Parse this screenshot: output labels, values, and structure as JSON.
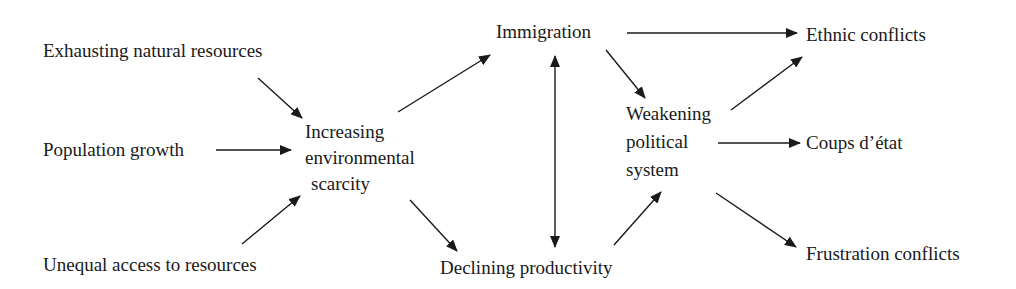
{
  "diagram": {
    "type": "causal-flow",
    "colors": {
      "text": "#1a1a1a",
      "arrow": "#1a1a1a",
      "background": "#ffffff"
    },
    "nodes": {
      "exhausting": {
        "label": "Exhausting natural resources"
      },
      "population": {
        "label": "Population growth"
      },
      "unequal": {
        "label": "Unequal access to resources"
      },
      "scarcity": {
        "lines": [
          "Increasing",
          "environmental",
          "scarcity"
        ]
      },
      "immigration": {
        "label": "Immigration"
      },
      "declining": {
        "label": "Declining productivity"
      },
      "weakening": {
        "lines": [
          "Weakening",
          "political",
          "system"
        ]
      },
      "ethnic": {
        "label": "Ethnic conflicts"
      },
      "coups": {
        "label": "Coups d’état"
      },
      "frustration": {
        "label": "Frustration conflicts"
      }
    },
    "edges": [
      {
        "from": "Exhausting natural resources",
        "to": "Increasing environmental scarcity"
      },
      {
        "from": "Population growth",
        "to": "Increasing environmental scarcity"
      },
      {
        "from": "Unequal access to resources",
        "to": "Increasing environmental scarcity"
      },
      {
        "from": "Increasing environmental scarcity",
        "to": "Immigration"
      },
      {
        "from": "Increasing environmental scarcity",
        "to": "Declining productivity"
      },
      {
        "from": "Immigration",
        "to": "Declining productivity",
        "bidirectional": true
      },
      {
        "from": "Immigration",
        "to": "Ethnic conflicts"
      },
      {
        "from": "Immigration",
        "to": "Weakening political system"
      },
      {
        "from": "Declining productivity",
        "to": "Weakening political system"
      },
      {
        "from": "Weakening political system",
        "to": "Ethnic conflicts"
      },
      {
        "from": "Weakening political system",
        "to": "Coups d’état"
      },
      {
        "from": "Weakening political system",
        "to": "Frustration conflicts"
      }
    ]
  }
}
